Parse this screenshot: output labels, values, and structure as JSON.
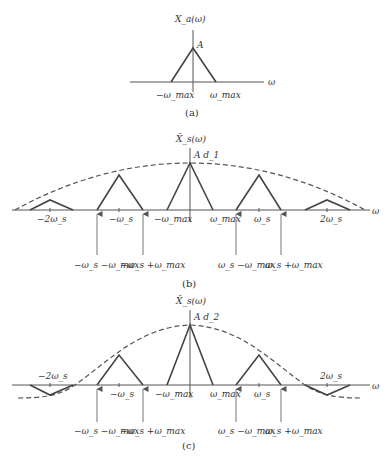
{
  "panel_a": {
    "title": "X_a(ω)",
    "peak_label": "A",
    "axis_label": "ω",
    "ticks": [
      "−ω_max",
      "ω_max"
    ],
    "caption": "(a)"
  },
  "panel_b": {
    "title": "X̂_s(ω)",
    "peak_label": "A d_1",
    "axis_label": "ω",
    "ticks": [
      "−2ω_s",
      "−ω_s",
      "−ω_max",
      "ω_max",
      "ω_s",
      "2ω_s"
    ],
    "arrow_labels": [
      "−ω_s −ω_max",
      "−ω_s +ω_max",
      "ω_s −ω_max",
      "ω_s +ω_max"
    ],
    "caption": "(b)"
  },
  "panel_c": {
    "title": "X̂_s(ω)",
    "peak_label": "A d_2",
    "axis_label": "ω",
    "ticks": [
      "−2ω_s",
      "−ω_s",
      "−ω_max",
      "ω_max",
      "ω_s",
      "2ω_s"
    ],
    "arrow_labels": [
      "−ω_s −ω_max",
      "−ω_s +ω_max",
      "ω_s −ω_max",
      "ω_s +ω_max"
    ],
    "caption": "(c)"
  }
}
